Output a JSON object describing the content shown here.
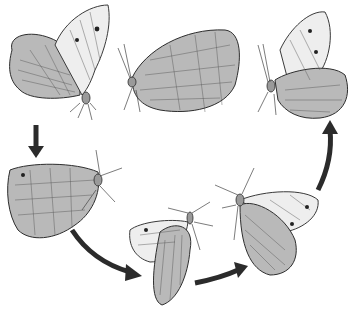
{
  "image": {
    "description": "Pencil illustration of a butterfly shown in six successive postures arranged in a cycle, connected by dark arrows",
    "background": "#ffffff",
    "ink_color": "#2b2b2b"
  },
  "butterflies": [
    {
      "id": 1,
      "position": "top-left",
      "pose": "wings half open, facing right, forewing raised with two eyespots"
    },
    {
      "id": 2,
      "position": "top-center",
      "pose": "wings closed, side view facing left"
    },
    {
      "id": 3,
      "position": "top-right",
      "pose": "wings partly open, facing left, forewing raised with eyespots"
    },
    {
      "id": 4,
      "position": "middle-left",
      "pose": "wings closed, side view facing right"
    },
    {
      "id": 5,
      "position": "bottom-center",
      "pose": "wings partly spread, viewed from above, body vertical"
    },
    {
      "id": 6,
      "position": "bottom-right",
      "pose": "wings spread, viewed from front, antennae up"
    }
  ],
  "arrows": [
    {
      "from": "top-left",
      "to": "middle-left",
      "direction": "down"
    },
    {
      "from": "middle-left",
      "to": "bottom-center",
      "direction": "curved down-right"
    },
    {
      "from": "bottom-center",
      "to": "bottom-right",
      "direction": "curved right"
    },
    {
      "from": "bottom-right",
      "to": "top-right",
      "direction": "curved up"
    }
  ]
}
